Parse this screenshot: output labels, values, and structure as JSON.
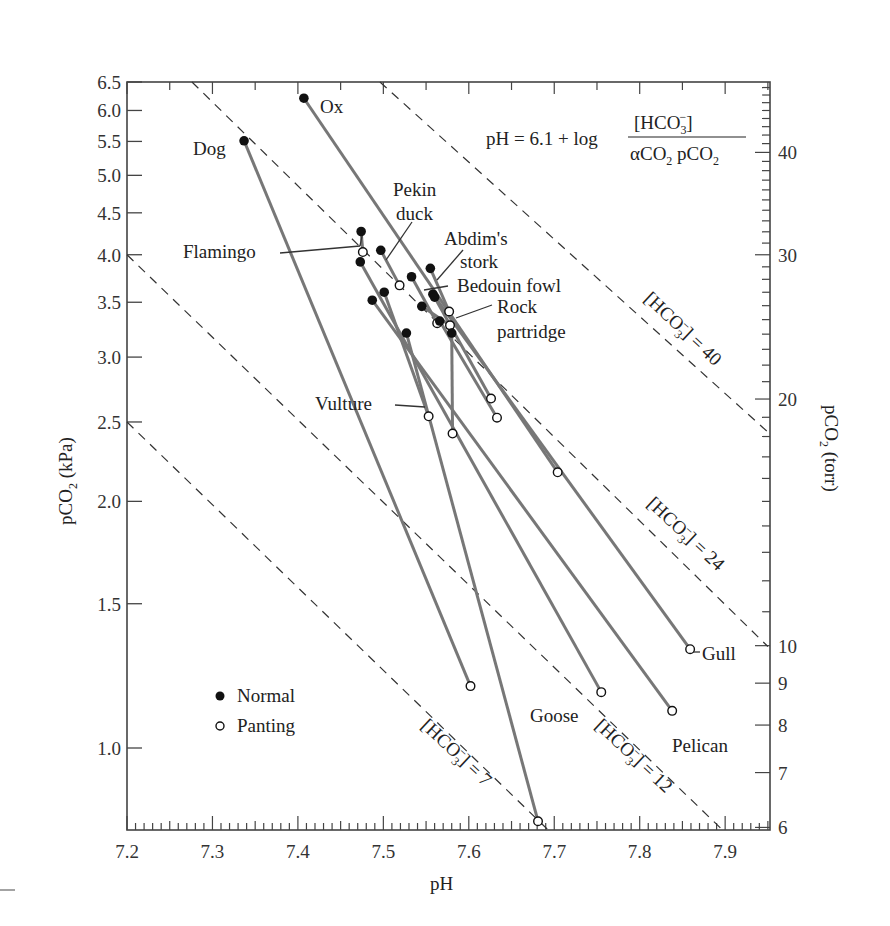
{
  "chart_data": {
    "type": "line",
    "title": "",
    "xlabel": "pH",
    "ylabel": "pCO2 (kPa)",
    "ylabel_right": "pCO2 (torr)",
    "xlim": [
      7.2,
      7.95
    ],
    "ylim": [
      0.794,
      6.5
    ],
    "yscale": "log",
    "grid": false,
    "x_ticks": [
      "7.2",
      "7.3",
      "7.4",
      "7.5",
      "7.6",
      "7.7",
      "7.8",
      "7.9"
    ],
    "y_ticks_left": [
      "1.0",
      "1.5",
      "2.0",
      "2.5",
      "3.0",
      "3.5",
      "4.0",
      "4.5",
      "5.0",
      "5.5",
      "6.0",
      "6.5"
    ],
    "y_ticks_right": [
      "6",
      "7",
      "8",
      "9",
      "10",
      "20",
      "30",
      "40",
      "50"
    ],
    "equation": {
      "lhs": "pH = 6.1 + log",
      "numerator": "[HCO3−]",
      "denominator": "αCO2 pCO2"
    },
    "legend": [
      {
        "marker": "filled",
        "label": "Normal"
      },
      {
        "marker": "open",
        "label": "Panting"
      }
    ],
    "isopleths": [
      {
        "label": "[HCO3−] = 7",
        "from": [
          7.2,
          2.5
        ],
        "to": [
          7.693,
          0.794
        ]
      },
      {
        "label": "[HCO3−] = 12",
        "from": [
          7.2,
          4.0
        ],
        "to": [
          7.897,
          0.794
        ]
      },
      {
        "label": "[HCO3−] = 24",
        "from": [
          7.276,
          6.5
        ],
        "to": [
          7.95,
          1.33
        ]
      },
      {
        "label": "[HCO3−] = 40",
        "from": [
          7.496,
          6.5
        ],
        "to": [
          7.95,
          2.43
        ]
      }
    ],
    "series": [
      {
        "name": "Dog",
        "normal": [
          7.337,
          5.51
        ],
        "panting": [
          7.602,
          1.19
        ]
      },
      {
        "name": "Ox",
        "normal": [
          7.407,
          6.21
        ],
        "panting": [
          7.704,
          2.17
        ]
      },
      {
        "name": "Flamingo",
        "normal": [
          7.474,
          4.27
        ],
        "panting": [
          7.476,
          4.03
        ]
      },
      {
        "name": "Pekin duck",
        "normal": [
          7.497,
          4.05
        ],
        "panting": [
          7.519,
          3.67
        ]
      },
      {
        "name": "Abdim's stork",
        "normal": [
          7.555,
          3.85
        ],
        "panting": [
          7.577,
          3.41
        ]
      },
      {
        "name": "Bedouin fowl",
        "normal": [
          7.533,
          3.76
        ],
        "panting": [
          7.563,
          3.3
        ]
      },
      {
        "name": "Rock partridge",
        "normal": [
          7.545,
          3.46
        ],
        "panting": [
          7.578,
          3.28
        ]
      },
      {
        "name": "Vulture",
        "normal": [
          7.501,
          3.6
        ],
        "panting": [
          7.553,
          2.54
        ]
      },
      {
        "name": "Goose",
        "normal": [
          7.473,
          3.92
        ],
        "panting": [
          7.755,
          1.17
        ]
      },
      {
        "name": "Pelican",
        "normal": [
          7.487,
          3.52
        ],
        "panting": [
          7.838,
          1.11
        ]
      },
      {
        "name": "Gull",
        "normal": [
          7.558,
          3.58
        ],
        "panting": [
          7.859,
          1.32
        ]
      },
      {
        "name": "Unlabeled A",
        "normal": [
          7.527,
          3.21
        ],
        "panting": [
          7.681,
          0.814
        ]
      },
      {
        "name": "Unlabeled B",
        "normal": [
          7.58,
          3.21
        ],
        "panting": [
          7.581,
          2.42
        ]
      },
      {
        "name": "Unlabeled C",
        "normal": [
          7.56,
          3.55
        ],
        "panting": [
          7.626,
          2.67
        ]
      },
      {
        "name": "Unlabeled D",
        "normal": [
          7.566,
          3.32
        ],
        "panting": [
          7.633,
          2.53
        ]
      }
    ]
  },
  "labels": {
    "ox": "Ox",
    "dog": "Dog",
    "pekin1": "Pekin",
    "pekin2": "duck",
    "flamingo": "Flamingo",
    "abdim1": "Abdim's",
    "abdim2": "stork",
    "bedouin": "Bedouin fowl",
    "rock1": "Rock",
    "rock2": "partridge",
    "vulture": "Vulture",
    "gull": "Gull",
    "goose": "Goose",
    "pelican": "Pelican",
    "normal": "Normal",
    "panting": "Panting",
    "hco_prefix": "[HCO",
    "hco_sub": "3",
    "hco_sup": "−",
    "eq7": "] = 7",
    "eq12": "] = 12",
    "eq24": "] = 24",
    "eq40": "] = 40",
    "xlabel": "pH",
    "ylabel_left_a": "pCO",
    "ylabel_left_b": "2",
    "ylabel_left_c": " (kPa)",
    "ylabel_right_a": "pCO",
    "ylabel_right_b": "2",
    "ylabel_right_c": " (torr)",
    "eq_lhs": "pH = 6.1 + log",
    "eq_num_a": "[HCO",
    "eq_num_b": "3",
    "eq_num_c": "−",
    "eq_num_d": "]",
    "eq_den_a": "αCO",
    "eq_den_b": "2",
    "eq_den_c": " pCO",
    "eq_den_d": "2"
  }
}
